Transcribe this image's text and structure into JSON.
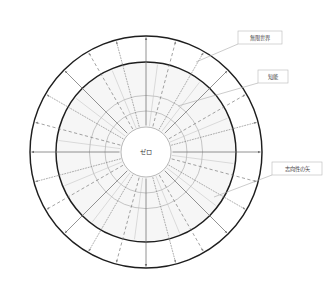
{
  "diagram": {
    "title_center": "ゼロ",
    "callouts": [
      {
        "id": "infinite-world",
        "label": "無限世界",
        "box_x": 238,
        "box_y": 31,
        "box_w": 44,
        "box_h": 13
      },
      {
        "id": "intelligence",
        "label": "知能",
        "box_x": 258,
        "box_y": 70,
        "box_w": 30,
        "box_h": 13
      },
      {
        "id": "intentionality-arrow",
        "label": "志向性の矢",
        "box_x": 272,
        "box_y": 162,
        "box_w": 50,
        "box_h": 13
      }
    ],
    "geometry": {
      "center_x": 146,
      "center_y": 152,
      "outer_radius": 116,
      "inner_radius": 90,
      "mid_ring_radius": 41,
      "core_radius": 25,
      "spoke_count": 24
    },
    "colors": {
      "stroke_bold": "#1e1e1e",
      "stroke_light": "#9a9a9a",
      "band_fill": "#f6f6f6",
      "callout_border": "#b9b9b9",
      "text": "#3a3a3a",
      "background": "#ffffff"
    },
    "spoke_styles": [
      "solid",
      "dashed",
      "dotted"
    ]
  }
}
